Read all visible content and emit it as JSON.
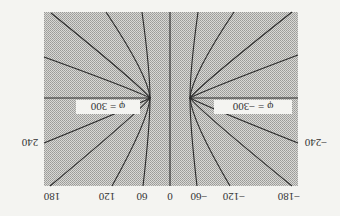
{
  "figure": {
    "orientation": "rotated-180",
    "fill_color": "#c9c9c6",
    "line_color": "#2a2a2a",
    "labels": {
      "bottom_ticks": [
        "180",
        "120",
        "60",
        "0",
        "−60",
        "−120",
        "−180"
      ],
      "left_side": "240",
      "right_side": "−240",
      "phi_left": "φ = 300",
      "phi_right": "φ = −300"
    }
  }
}
